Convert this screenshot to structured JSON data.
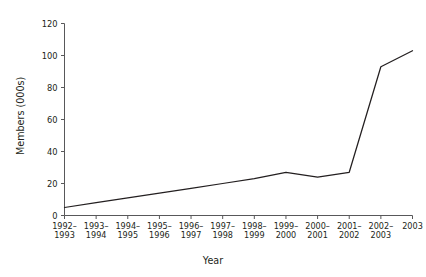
{
  "chart_data": {
    "type": "line",
    "title": "",
    "xlabel": "Year",
    "ylabel": "Members (000s)",
    "categories": [
      "1992–1993",
      "1993–1994",
      "1994–1995",
      "1995–1996",
      "1996–1997",
      "1997–1998",
      "1998–1999",
      "1999–2000",
      "2000–2001",
      "2001–2002",
      "2002–2003",
      "2003"
    ],
    "category_lines": [
      [
        "1992–",
        "1993"
      ],
      [
        "1993–",
        "1994"
      ],
      [
        "1994–",
        "1995"
      ],
      [
        "1995–",
        "1996"
      ],
      [
        "1996–",
        "1997"
      ],
      [
        "1997–",
        "1998"
      ],
      [
        "1998–",
        "1999"
      ],
      [
        "1999–",
        "2000"
      ],
      [
        "2000–",
        "2001"
      ],
      [
        "2001–",
        "2002"
      ],
      [
        "2002–",
        "2003"
      ],
      [
        "2003",
        ""
      ]
    ],
    "values": [
      5,
      8,
      11,
      14,
      17,
      20,
      23,
      27,
      24,
      27,
      93,
      103
    ],
    "ylim": [
      0,
      120
    ],
    "yticks": [
      0,
      20,
      40,
      60,
      80,
      100,
      120
    ],
    "ytick_labels": [
      "0",
      "20",
      "40",
      "60",
      "80",
      "100",
      "120"
    ],
    "grid": false,
    "legend": false,
    "series": [
      {
        "name": "Members",
        "values": [
          5,
          8,
          11,
          14,
          17,
          20,
          23,
          27,
          24,
          27,
          93,
          103
        ],
        "color": "#231f20"
      }
    ]
  },
  "colors": {
    "line": "#231f20",
    "axis": "#58585a",
    "background": "#ffffff",
    "text": "#231f20"
  }
}
